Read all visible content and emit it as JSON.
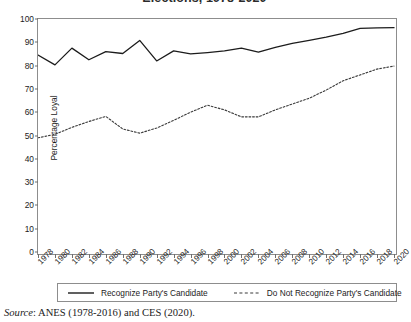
{
  "chart_data": {
    "type": "line",
    "title": "Elections, 1978-2020",
    "xlabel": "",
    "ylabel": "Percentage Loyal",
    "ylim": [
      0,
      100
    ],
    "ytick_step": 10,
    "yticks": [
      0,
      10,
      20,
      30,
      40,
      50,
      60,
      70,
      80,
      90,
      100
    ],
    "grid": false,
    "legend_position": "bottom",
    "categories": [
      1978,
      1980,
      1982,
      1984,
      1986,
      1988,
      1990,
      1992,
      1994,
      1996,
      1998,
      2000,
      2002,
      2004,
      2006,
      2008,
      2010,
      2012,
      2014,
      2016,
      2018,
      2020
    ],
    "xticks": [
      "1978",
      "1980",
      "1982",
      "1984",
      "1986",
      "1988",
      "1990",
      "1992",
      "1994",
      "1996",
      "1998",
      "2000",
      "2002",
      "2004",
      "2006",
      "2008",
      "2010",
      "2012",
      "2014",
      "2016",
      "2018",
      "2020"
    ],
    "series": [
      {
        "name": "Recognize Party's Candidate",
        "style": "solid",
        "color": "#1c1c1c",
        "values": [
          84.5,
          80.3,
          87.5,
          82.5,
          86.0,
          85.2,
          90.8,
          82.0,
          86.3,
          85.0,
          85.6,
          86.3,
          87.5,
          85.8,
          87.8,
          89.5,
          90.8,
          92.2,
          93.8,
          96.0,
          96.2,
          96.3
        ]
      },
      {
        "name": "Do Not Recognize Party's Candidate",
        "style": "dashed",
        "color": "#3a3a3a",
        "values": [
          49.0,
          50.5,
          53.5,
          56.0,
          58.2,
          52.8,
          51.0,
          53.2,
          56.5,
          60.0,
          63.0,
          61.0,
          58.0,
          58.0,
          61.0,
          63.5,
          66.0,
          69.5,
          73.5,
          76.0,
          78.5,
          79.8
        ]
      }
    ]
  },
  "source": {
    "prefix": "Source",
    "text": ": ANES (1978-2016) and CES (2020)."
  }
}
